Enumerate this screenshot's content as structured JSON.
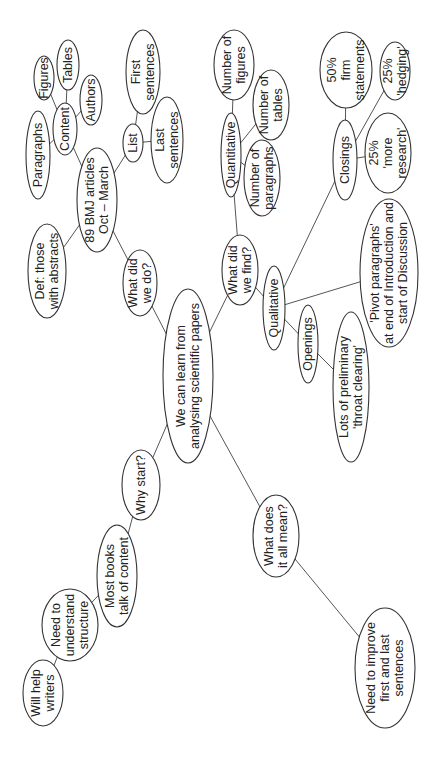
{
  "diagram": {
    "type": "mind-map",
    "orientation": "rotated-90-ccw",
    "central": {
      "id": "root",
      "lines": [
        "We can learn from",
        "analysing scientific papers"
      ]
    },
    "nodes": [
      {
        "id": "root",
        "lines": [
          "We can learn from",
          "analysing scientific papers"
        ],
        "cx": 188,
        "cy": 376,
        "rx": 25,
        "ry": 87
      },
      {
        "id": "what-did-we-do",
        "lines": [
          "What did",
          "we do?"
        ],
        "cx": 140,
        "cy": 283,
        "rx": 17,
        "ry": 33
      },
      {
        "id": "bmj-articles",
        "lines": [
          "89 BMJ articles",
          "Oct – March"
        ],
        "cx": 97,
        "cy": 200,
        "rx": 20,
        "ry": 52
      },
      {
        "id": "def-abstracts",
        "lines": [
          "Def: those",
          "with abstracts"
        ],
        "cx": 47,
        "cy": 271,
        "rx": 19,
        "ry": 47
      },
      {
        "id": "content",
        "lines": [
          "Content"
        ],
        "cx": 65,
        "cy": 129,
        "rx": 12,
        "ry": 26
      },
      {
        "id": "paragraphs",
        "lines": [
          "Paragraphs"
        ],
        "cx": 38,
        "cy": 155,
        "rx": 12,
        "ry": 44
      },
      {
        "id": "figures",
        "lines": [
          "Figures"
        ],
        "cx": 44,
        "cy": 78,
        "rx": 10,
        "ry": 22
      },
      {
        "id": "tables",
        "lines": [
          "Tables"
        ],
        "cx": 68,
        "cy": 65,
        "rx": 11,
        "ry": 25
      },
      {
        "id": "authors",
        "lines": [
          "Authors"
        ],
        "cx": 91,
        "cy": 100,
        "rx": 11,
        "ry": 25
      },
      {
        "id": "list",
        "lines": [
          "List"
        ],
        "cx": 133,
        "cy": 143,
        "rx": 10,
        "ry": 19
      },
      {
        "id": "first-sentences",
        "lines": [
          "First",
          "sentences"
        ],
        "cx": 143,
        "cy": 72,
        "rx": 17,
        "ry": 42
      },
      {
        "id": "last-sentences",
        "lines": [
          "Last",
          "sentences"
        ],
        "cx": 167,
        "cy": 140,
        "rx": 16,
        "ry": 43
      },
      {
        "id": "what-did-we-find",
        "lines": [
          "What did",
          "we find?"
        ],
        "cx": 240,
        "cy": 270,
        "rx": 18,
        "ry": 35
      },
      {
        "id": "quantitative",
        "lines": [
          "Quantitative"
        ],
        "cx": 231,
        "cy": 155,
        "rx": 10,
        "ry": 42
      },
      {
        "id": "number-of-figures",
        "lines": [
          "Number of",
          "figures"
        ],
        "cx": 234,
        "cy": 65,
        "rx": 20,
        "ry": 35
      },
      {
        "id": "number-of-tables",
        "lines": [
          "Number of",
          "tables"
        ],
        "cx": 271,
        "cy": 105,
        "rx": 18,
        "ry": 35
      },
      {
        "id": "number-of-paragraphs",
        "lines": [
          "Number of",
          "paragraphs"
        ],
        "cx": 262,
        "cy": 178,
        "rx": 18,
        "ry": 38
      },
      {
        "id": "qualitative",
        "lines": [
          "Qualitative"
        ],
        "cx": 274,
        "cy": 308,
        "rx": 11,
        "ry": 42
      },
      {
        "id": "closings",
        "lines": [
          "Closings"
        ],
        "cx": 345,
        "cy": 160,
        "rx": 12,
        "ry": 40
      },
      {
        "id": "firm-statements",
        "lines": [
          "50%",
          "firm",
          "statements"
        ],
        "cx": 346,
        "cy": 70,
        "rx": 26,
        "ry": 38
      },
      {
        "id": "hedging",
        "lines": [
          "25%",
          "'hedging'"
        ],
        "cx": 395,
        "cy": 71,
        "rx": 15,
        "ry": 29
      },
      {
        "id": "more-research",
        "lines": [
          "25%",
          "'more",
          "research'"
        ],
        "cx": 388,
        "cy": 153,
        "rx": 23,
        "ry": 40
      },
      {
        "id": "pivot-paragraphs",
        "lines": [
          "'Pivot paragraphs'",
          "at end of Introduction and",
          "start of Discussion"
        ],
        "cx": 389,
        "cy": 273,
        "rx": 29,
        "ry": 74
      },
      {
        "id": "openings",
        "lines": [
          "Openings"
        ],
        "cx": 308,
        "cy": 344,
        "rx": 10,
        "ry": 39
      },
      {
        "id": "throat-clearing",
        "lines": [
          "Lots of preliminary",
          "'throat clearing'"
        ],
        "cx": 351,
        "cy": 387,
        "rx": 18,
        "ry": 75
      },
      {
        "id": "why-start",
        "lines": [
          "Why start?"
        ],
        "cx": 141,
        "cy": 485,
        "rx": 19,
        "ry": 35
      },
      {
        "id": "most-books",
        "lines": [
          "Most books",
          "talk of content"
        ],
        "cx": 117,
        "cy": 576,
        "rx": 20,
        "ry": 51
      },
      {
        "id": "need-structure",
        "lines": [
          "Need to",
          "understand",
          "structure"
        ],
        "cx": 70,
        "cy": 625,
        "rx": 28,
        "ry": 36
      },
      {
        "id": "will-help-writers",
        "lines": [
          "Will help",
          "writers"
        ],
        "cx": 43,
        "cy": 693,
        "rx": 20,
        "ry": 33
      },
      {
        "id": "what-does-it-mean",
        "lines": [
          "What does",
          "it all mean?"
        ],
        "cx": 276,
        "cy": 536,
        "rx": 23,
        "ry": 41
      },
      {
        "id": "need-improve",
        "lines": [
          "Need to improve",
          "first and last",
          "sentences"
        ],
        "cx": 385,
        "cy": 668,
        "rx": 30,
        "ry": 60
      }
    ],
    "edges": [
      [
        "root",
        "what-did-we-do"
      ],
      [
        "what-did-we-do",
        "bmj-articles"
      ],
      [
        "bmj-articles",
        "def-abstracts"
      ],
      [
        "bmj-articles",
        "content"
      ],
      [
        "content",
        "paragraphs"
      ],
      [
        "content",
        "figures"
      ],
      [
        "content",
        "tables"
      ],
      [
        "content",
        "authors"
      ],
      [
        "bmj-articles",
        "list"
      ],
      [
        "list",
        "first-sentences"
      ],
      [
        "list",
        "last-sentences"
      ],
      [
        "root",
        "what-did-we-find"
      ],
      [
        "what-did-we-find",
        "quantitative"
      ],
      [
        "quantitative",
        "number-of-figures"
      ],
      [
        "quantitative",
        "number-of-tables"
      ],
      [
        "quantitative",
        "number-of-paragraphs"
      ],
      [
        "what-did-we-find",
        "qualitative"
      ],
      [
        "qualitative",
        "closings"
      ],
      [
        "closings",
        "firm-statements"
      ],
      [
        "closings",
        "hedging"
      ],
      [
        "closings",
        "more-research"
      ],
      [
        "qualitative",
        "pivot-paragraphs"
      ],
      [
        "qualitative",
        "openings"
      ],
      [
        "openings",
        "throat-clearing"
      ],
      [
        "root",
        "why-start"
      ],
      [
        "why-start",
        "most-books"
      ],
      [
        "most-books",
        "need-structure"
      ],
      [
        "need-structure",
        "will-help-writers"
      ],
      [
        "root",
        "what-does-it-mean"
      ],
      [
        "what-does-it-mean",
        "need-improve"
      ]
    ],
    "colors": {
      "background": "#ffffff",
      "stroke": "#333333",
      "edge": "#555555",
      "text": "#222222"
    }
  }
}
